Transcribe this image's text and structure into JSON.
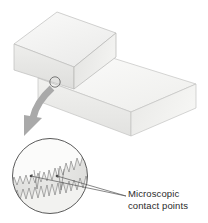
{
  "figure": {
    "background_color": "#ffffff",
    "label": {
      "line1": "Microscopic",
      "line2": "contact points",
      "color": "#2b2b2b"
    },
    "blocks": [
      {
        "name": "upper-block",
        "description": "Small isometric rectangular block resting on the lower block",
        "top_face_color": "#f0f0ee",
        "front_face_color": "#e6e6e4",
        "side_face_color": "#dcdcda",
        "outline_color": "#b9b9b7"
      },
      {
        "name": "lower-block",
        "description": "Large isometric rectangular slab acting as the supporting surface",
        "top_face_color": "#f4f4f2",
        "front_face_color": "#eaeae8",
        "side_face_color": "#e0e0de",
        "outline_color": "#bdbdbb"
      }
    ],
    "callout_marker": {
      "name": "contact-point-marker",
      "shape": "circle",
      "cx": 55,
      "cy": 82,
      "r": 5,
      "stroke_color": "#555555"
    },
    "callout_arrow": {
      "name": "magnify-arrow",
      "description": "Curved gray arrow sweeping from the contact point down to the magnified inset",
      "color": "#a8a8a8"
    },
    "magnified_inset": {
      "name": "magnified-surface-detail",
      "cx": 50,
      "cy": 176,
      "r": 38,
      "fill_color": "#e2e2e0",
      "stroke_color": "#4a4a4a",
      "description": "Magnified circular view showing two jagged rough surfaces touching at a few microscopic asperity peaks"
    },
    "leader_lines": {
      "name": "contact-point-leaders",
      "count": 2,
      "color": "#555555",
      "description": "Two thin lines running from the microscopic contact points out to the text label"
    }
  }
}
